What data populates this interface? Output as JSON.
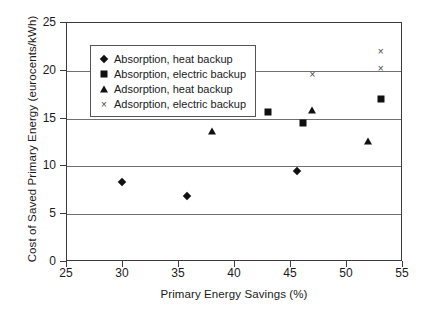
{
  "chart_data": {
    "type": "scatter",
    "title": "",
    "xlabel": "Primary Energy Savings (%)",
    "ylabel": "Cost of Saved Primary Energy (eurocents/kWh)",
    "xlim": [
      25,
      55
    ],
    "ylim": [
      0,
      25
    ],
    "xticks": [
      25,
      30,
      35,
      40,
      45,
      50,
      55
    ],
    "yticks": [
      0,
      5,
      10,
      15,
      20,
      25
    ],
    "grid": "horizontal",
    "legend_position": "upper-left-inside",
    "series": [
      {
        "name": "Absorption, heat backup",
        "marker": "diamond",
        "color": "#111111",
        "points": [
          {
            "x": 30.0,
            "y": 8.3
          },
          {
            "x": 35.8,
            "y": 6.8
          },
          {
            "x": 45.6,
            "y": 9.4
          }
        ]
      },
      {
        "name": "Absorption, electric backup",
        "marker": "square",
        "color": "#111111",
        "points": [
          {
            "x": 43.0,
            "y": 15.6
          },
          {
            "x": 46.2,
            "y": 14.4
          },
          {
            "x": 53.1,
            "y": 16.9
          }
        ]
      },
      {
        "name": "Adsorption, heat backup",
        "marker": "triangle",
        "color": "#111111",
        "points": [
          {
            "x": 38.0,
            "y": 13.6
          },
          {
            "x": 47.0,
            "y": 15.8
          },
          {
            "x": 52.0,
            "y": 12.6
          }
        ]
      },
      {
        "name": "Adsorption, electric backup",
        "marker": "cross",
        "color": "#444444",
        "glyph": "×",
        "points": [
          {
            "x": 47.0,
            "y": 19.6
          },
          {
            "x": 53.1,
            "y": 20.2
          },
          {
            "x": 53.1,
            "y": 22.0
          }
        ]
      }
    ]
  },
  "legend": {
    "entries": [
      {
        "label": "Absorption, heat backup",
        "marker": "diamond"
      },
      {
        "label": "Absorption, electric backup",
        "marker": "square"
      },
      {
        "label": "Adsorption, heat backup",
        "marker": "triangle"
      },
      {
        "label": "Adsorption, electric backup",
        "marker": "cross"
      }
    ]
  }
}
